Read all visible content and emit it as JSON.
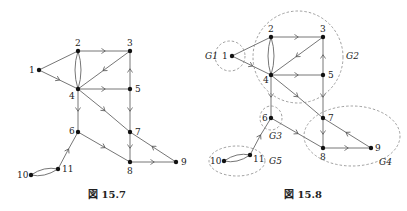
{
  "figures": [
    {
      "id": "fig-15-7",
      "caption": "図 15.7",
      "nodes": [
        {
          "id": "1",
          "label": "1",
          "x": 39,
          "y": 70
        },
        {
          "id": "2",
          "label": "2",
          "x": 78,
          "y": 51
        },
        {
          "id": "3",
          "label": "3",
          "x": 130,
          "y": 51
        },
        {
          "id": "4",
          "label": "4",
          "x": 78,
          "y": 89
        },
        {
          "id": "5",
          "label": "5",
          "x": 130,
          "y": 89
        },
        {
          "id": "6",
          "label": "6",
          "x": 78,
          "y": 132
        },
        {
          "id": "7",
          "label": "7",
          "x": 130,
          "y": 132
        },
        {
          "id": "8",
          "label": "8",
          "x": 130,
          "y": 162
        },
        {
          "id": "9",
          "label": "9",
          "x": 176,
          "y": 162
        },
        {
          "id": "10",
          "label": "10",
          "x": 31,
          "y": 175
        },
        {
          "id": "11",
          "label": "11",
          "x": 58,
          "y": 169
        }
      ]
    },
    {
      "id": "fig-15-8",
      "caption": "図 15.8",
      "groups": [
        "G1",
        "G2",
        "G3",
        "G4",
        "G5"
      ]
    }
  ],
  "edges": [
    [
      "1",
      "2"
    ],
    [
      "1",
      "4"
    ],
    [
      "2",
      "3"
    ],
    [
      "2",
      "4"
    ],
    [
      "4",
      "2"
    ],
    [
      "3",
      "4"
    ],
    [
      "4",
      "5"
    ],
    [
      "5",
      "3"
    ],
    [
      "5",
      "7"
    ],
    [
      "4",
      "7"
    ],
    [
      "4",
      "6"
    ],
    [
      "6",
      "8"
    ],
    [
      "7",
      "8"
    ],
    [
      "9",
      "7"
    ],
    [
      "8",
      "9"
    ],
    [
      "11",
      "6"
    ],
    [
      "10",
      "11"
    ],
    [
      "11",
      "10"
    ]
  ],
  "group_labels": {
    "G1": "G1",
    "G2": "G2",
    "G3": "G3",
    "G4": "G4",
    "G5": "G5"
  }
}
